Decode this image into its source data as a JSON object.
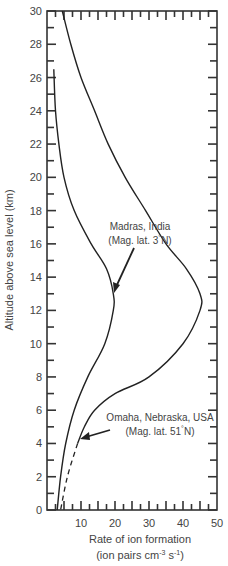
{
  "chart_data": {
    "type": "line",
    "title": "",
    "xlabel": "Rate of ion formation",
    "xlabel_units": "(ion pairs cm-3 s-1)",
    "ylabel": "Altitude above sea level (km)",
    "xlim": [
      0,
      50
    ],
    "ylim": [
      0,
      30
    ],
    "x_ticks": [
      10,
      20,
      30,
      40,
      50
    ],
    "y_ticks": [
      0,
      2,
      4,
      6,
      8,
      10,
      12,
      14,
      16,
      18,
      20,
      22,
      24,
      26,
      28,
      30
    ],
    "grid": false,
    "series": [
      {
        "name": "Madras, India (Mag. lat. 3°N)",
        "points": [
          [
            2.0,
            26.5
          ],
          [
            2.5,
            24
          ],
          [
            3.5,
            22
          ],
          [
            5,
            20
          ],
          [
            8,
            18
          ],
          [
            13,
            16
          ],
          [
            17.5,
            14.5
          ],
          [
            19.5,
            13
          ],
          [
            19.5,
            12
          ],
          [
            17,
            10
          ],
          [
            12,
            8
          ],
          [
            8,
            6
          ],
          [
            5.5,
            4
          ],
          [
            4,
            2
          ],
          [
            3,
            0
          ]
        ]
      },
      {
        "name": "Omaha, Nebraska, USA (Mag. lat. 51°N)",
        "points": [
          [
            4.5,
            30
          ],
          [
            7,
            28
          ],
          [
            10,
            26
          ],
          [
            14,
            24
          ],
          [
            18,
            22
          ],
          [
            23,
            20
          ],
          [
            29,
            18
          ],
          [
            35,
            16
          ],
          [
            41,
            14.5
          ],
          [
            45,
            13
          ],
          [
            45,
            12
          ],
          [
            40,
            10
          ],
          [
            30,
            8
          ],
          [
            20,
            7
          ],
          [
            14,
            6
          ],
          [
            11,
            5
          ],
          [
            9,
            4
          ]
        ],
        "dashed_extension": [
          [
            9,
            4
          ],
          [
            6,
            2
          ],
          [
            4,
            0
          ]
        ]
      }
    ],
    "annotations": [
      {
        "text": "Madras, India",
        "line2": "(Mag. lat. 3°N)",
        "points_to": [
          19.5,
          13
        ]
      },
      {
        "text": "Omaha, Nebraska, USA",
        "line2": "(Mag. lat. 51°N)",
        "points_to": [
          9,
          4
        ]
      }
    ]
  },
  "labels": {
    "ylabel": "Altitude above sea level (km)",
    "xlabel_line1": "Rate of ion formation",
    "xlabel_line2_pre": "(ion pairs cm",
    "xlabel_sup1": "-3",
    "xlabel_mid": " s",
    "xlabel_sup2": "-1",
    "xlabel_end": ")",
    "madras_line1": "Madras, India",
    "madras_line2": "(Mag. lat. 3",
    "madras_deg": "°",
    "madras_line2_end": "N)",
    "omaha_line1": "Omaha, Nebraska, USA",
    "omaha_line2": "(Mag. lat. 51",
    "omaha_deg": "°",
    "omaha_line2_end": "N)",
    "y_tick_labels": [
      "0",
      "2",
      "4",
      "6",
      "8",
      "10",
      "12",
      "14",
      "16",
      "18",
      "20",
      "22",
      "24",
      "26",
      "28",
      "30"
    ],
    "x_tick_labels": [
      "10",
      "20",
      "30",
      "40",
      "50"
    ]
  }
}
